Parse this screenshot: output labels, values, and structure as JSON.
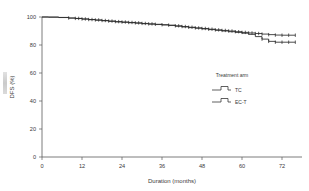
{
  "figure": {
    "name": "kaplan-meier-dfs-plot",
    "background_color": "#ffffff",
    "line_color": "#2b2b2b",
    "axis_color": "#5a5a5a"
  },
  "axes": {
    "x": {
      "label": "Duration (months)",
      "ticks": [
        0,
        12,
        24,
        36,
        48,
        60,
        72
      ],
      "tick_labels": [
        "0",
        "12",
        "24",
        "36",
        "48",
        "60",
        "72"
      ],
      "min": 0,
      "max": 78
    },
    "y": {
      "label": "DFS (%)",
      "ticks": [
        0,
        20,
        40,
        60,
        80,
        100
      ],
      "tick_labels": [
        "0",
        "20",
        "40",
        "60",
        "80",
        "100"
      ],
      "min": 0,
      "max": 100
    }
  },
  "legend": {
    "title": "Treatment arm",
    "position": "inside-right-middle",
    "entries": [
      {
        "label": "TC",
        "marker": "step-line-censored"
      },
      {
        "label": "EC-T",
        "marker": "step-line-censored"
      }
    ]
  },
  "chart_data": {
    "type": "line",
    "title": "",
    "subtitle": "",
    "xlabel": "Duration (months)",
    "ylabel": "DFS (%)",
    "xlim": [
      0,
      78
    ],
    "ylim": [
      0,
      100
    ],
    "xticks": [
      0,
      12,
      24,
      36,
      48,
      60,
      72
    ],
    "yticks": [
      0,
      20,
      40,
      60,
      80,
      100
    ],
    "grid": false,
    "legend_position": "inside-right-middle",
    "legend_title": "Treatment arm",
    "series": [
      {
        "name": "TC",
        "x": [
          0,
          2,
          5,
          8,
          10,
          12,
          14,
          16,
          18,
          20,
          22,
          24,
          26,
          28,
          30,
          32,
          34,
          36,
          38,
          40,
          42,
          44,
          46,
          48,
          50,
          52,
          54,
          56,
          58,
          60,
          62,
          64,
          66,
          68,
          70,
          72,
          74,
          76
        ],
        "y": [
          100,
          99.9,
          99.7,
          99.3,
          99.0,
          98.6,
          98.2,
          97.9,
          97.5,
          97.1,
          96.7,
          96.4,
          96.1,
          95.8,
          95.4,
          95.1,
          94.8,
          94.5,
          94.2,
          93.7,
          93.2,
          92.7,
          92.2,
          91.8,
          91.3,
          90.8,
          90.4,
          90.0,
          89.5,
          89.0,
          88.6,
          88.2,
          87.8,
          87.4,
          87.1,
          87.0,
          87.0,
          87.0
        ],
        "censored_x": [
          8,
          10,
          11,
          12,
          13,
          14,
          15,
          16,
          17,
          18,
          19,
          20,
          21,
          22,
          23,
          24,
          25,
          26,
          27,
          28,
          29,
          30,
          31,
          32,
          33,
          34,
          36,
          38,
          40,
          41,
          42,
          43,
          44,
          45,
          46,
          47,
          48,
          49,
          50,
          51,
          52,
          53,
          54,
          55,
          56,
          57,
          58,
          59,
          60,
          61,
          62,
          63,
          64,
          65,
          66,
          68,
          70,
          72,
          74,
          76
        ]
      },
      {
        "name": "EC-T",
        "x": [
          0,
          2,
          5,
          8,
          10,
          12,
          14,
          16,
          18,
          20,
          22,
          24,
          26,
          28,
          30,
          32,
          34,
          36,
          38,
          40,
          42,
          44,
          46,
          48,
          50,
          52,
          54,
          56,
          58,
          60,
          62,
          64,
          66,
          68,
          70,
          72,
          74,
          76
        ],
        "y": [
          100,
          99.9,
          99.6,
          99.2,
          98.9,
          98.5,
          98.1,
          97.7,
          97.3,
          96.9,
          96.5,
          96.2,
          95.9,
          95.6,
          95.2,
          94.9,
          94.6,
          94.3,
          93.9,
          93.4,
          92.9,
          92.4,
          92.0,
          91.5,
          91.0,
          90.5,
          90.0,
          89.5,
          89.0,
          88.4,
          87.6,
          86.0,
          84.2,
          82.6,
          82.0,
          82.0,
          82.0,
          82.0
        ],
        "censored_x": [
          66,
          68,
          70,
          72,
          74,
          76
        ]
      }
    ],
    "annotations": [
      "Two treatment arms overlap closely until approximately 62 months, then separate with TC remaining near 87% and EC-T dropping to about 82%."
    ]
  }
}
